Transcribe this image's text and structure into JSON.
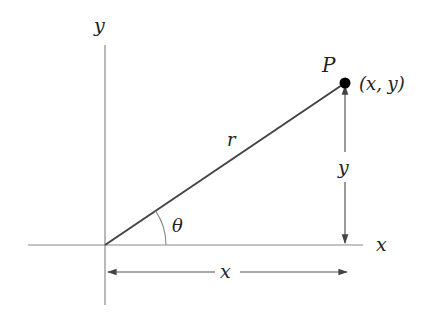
{
  "diagram": {
    "colors": {
      "background": "#ffffff",
      "axis": "#8a8a8a",
      "segment": "#444444",
      "measure": "#555555",
      "point": "#000000",
      "text": "#222222"
    },
    "axes": {
      "x_label": "x",
      "y_label": "y"
    },
    "point": {
      "name": "P",
      "coords_label": "(x, y)"
    },
    "segment": {
      "label": "r"
    },
    "angle": {
      "label": "θ"
    },
    "measures": {
      "horizontal_label": "x",
      "vertical_label": "y"
    }
  }
}
